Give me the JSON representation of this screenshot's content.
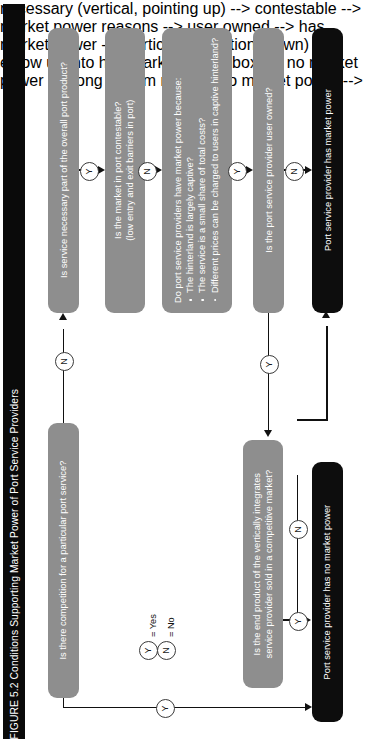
{
  "figure": {
    "title": "FIGURE 5.2 Conditions Supporting Market Power of Port Service Providers",
    "orientation": "rotated-90-ccw",
    "title_bg": "#0a0a0a",
    "title_fg": "#ffffff",
    "decision_color": "#8e8e8e",
    "terminal_color": "#0d0d0d"
  },
  "nodes": {
    "competition": {
      "label": "Is there competition for a particular port service?",
      "type": "decision"
    },
    "necessary": {
      "label": "Is service necessary part of the overall port product?",
      "type": "decision"
    },
    "contestable_l1": {
      "label": "Is the market in port contestable?",
      "type": "decision"
    },
    "contestable_l2": {
      "label": "(low entry and exit barriers in port)",
      "type": "decision"
    },
    "marketpower_head": {
      "label": "Do port service providers have market power because:",
      "type": "decision"
    },
    "marketpower_b1": {
      "label": "The hinterland is largely captive?",
      "type": "bullet"
    },
    "marketpower_b2": {
      "label": "The service is a small share of total costs?",
      "type": "bullet"
    },
    "marketpower_b3": {
      "label": "Different prices can be charged to users in captive hinterland?",
      "type": "bullet"
    },
    "userowned": {
      "label": "Is the port service provider user owned?",
      "type": "decision"
    },
    "vertical_l1": {
      "label": "Is the end product of the vertically integrates",
      "type": "decision"
    },
    "vertical_l2": {
      "label": "service provider sold in a competitive market?",
      "type": "decision"
    },
    "has_power": {
      "label": "Port service provider has market power",
      "type": "terminal"
    },
    "no_power": {
      "label": "Port service provider has no market power",
      "type": "terminal"
    }
  },
  "edges": {
    "competition_no": "N",
    "competition_yes": "Y",
    "necessary_yes": "Y",
    "contestable_no": "N",
    "marketpower_yes": "Y",
    "userowned_no": "N",
    "userowned_yes": "Y",
    "vertical_no": "N",
    "vertical_yes": "Y"
  },
  "legend": {
    "yes_symbol": "Y",
    "yes_text": "= Yes",
    "no_symbol": "N",
    "no_text": "= No"
  }
}
